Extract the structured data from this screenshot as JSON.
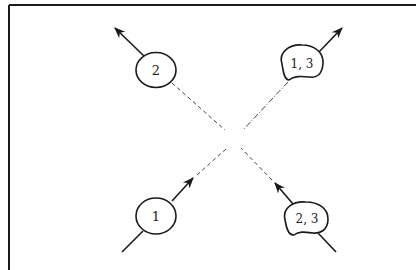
{
  "diagram": {
    "type": "scattering-diagram",
    "frame": {
      "stroke": "#1a1a1a",
      "sides": [
        "top",
        "left"
      ]
    },
    "colors": {
      "ink": "#1a1a1a",
      "background": "#ffffff"
    },
    "nodes": [
      {
        "id": "node-2",
        "label": "2",
        "shape": "circle",
        "position": "top-left",
        "direction": "outgoing"
      },
      {
        "id": "node-1-3",
        "label": "1, 3",
        "shape": "blob",
        "position": "top-right",
        "direction": "outgoing"
      },
      {
        "id": "node-1",
        "label": "1",
        "shape": "circle",
        "position": "bottom-left",
        "direction": "incoming"
      },
      {
        "id": "node-2-3",
        "label": "2, 3",
        "shape": "blob",
        "position": "bottom-right",
        "direction": "incoming"
      }
    ],
    "connectors": [
      {
        "from": "node-1",
        "to": "center",
        "style": "dashed"
      },
      {
        "from": "node-2-3",
        "to": "center",
        "style": "dashed"
      },
      {
        "from": "center",
        "to": "node-2",
        "style": "dashed"
      },
      {
        "from": "center",
        "to": "node-1-3",
        "style": "dash-dot"
      }
    ]
  }
}
